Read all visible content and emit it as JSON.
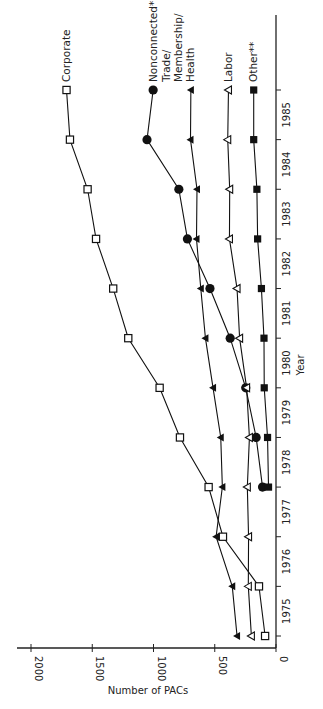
{
  "chart_data": {
    "type": "line",
    "orientation": "rotated-90",
    "title": "",
    "xlabel": "Year",
    "ylabel": "Number of PACs",
    "ylim": [
      0,
      2000
    ],
    "yticks": [
      0,
      500,
      1000,
      1500,
      2000
    ],
    "year_labels": [
      "1975",
      "1976",
      "1977",
      "1978",
      "1979",
      "1980",
      "1981",
      "1982",
      "1983",
      "1984",
      "1985"
    ],
    "x": [
      "1974",
      "1975",
      "1976",
      "1977",
      "1978",
      "1979",
      "1980",
      "1981",
      "1982",
      "1983",
      "1984",
      "1985"
    ],
    "grid": false,
    "legend_position": "line-end labels",
    "series": [
      {
        "name": "Corporate",
        "marker": "open-square",
        "values": [
          89,
          139,
          433,
          550,
          784,
          950,
          1206,
          1329,
          1469,
          1538,
          1682,
          1710
        ]
      },
      {
        "name": "Nonconnected*",
        "marker": "filled-circle",
        "values": [
          null,
          null,
          null,
          110,
          162,
          247,
          374,
          539,
          723,
          793,
          1053,
          1003
        ]
      },
      {
        "name": "Trade/ Membership/ Health",
        "label_lines": [
          "Trade/",
          "Membership/",
          "Health"
        ],
        "marker": "filled-triangle",
        "values": [
          318,
          357,
          489,
          438,
          451,
          514,
          576,
          614,
          649,
          645,
          698,
          695
        ]
      },
      {
        "name": "Labor",
        "marker": "open-triangle",
        "values": [
          201,
          226,
          224,
          234,
          217,
          240,
          297,
          318,
          380,
          378,
          394,
          388
        ]
      },
      {
        "name": "Other**",
        "marker": "filled-square",
        "values": [
          null,
          null,
          null,
          61,
          69,
          96,
          98,
          119,
          150,
          156,
          182,
          182
        ]
      }
    ]
  }
}
